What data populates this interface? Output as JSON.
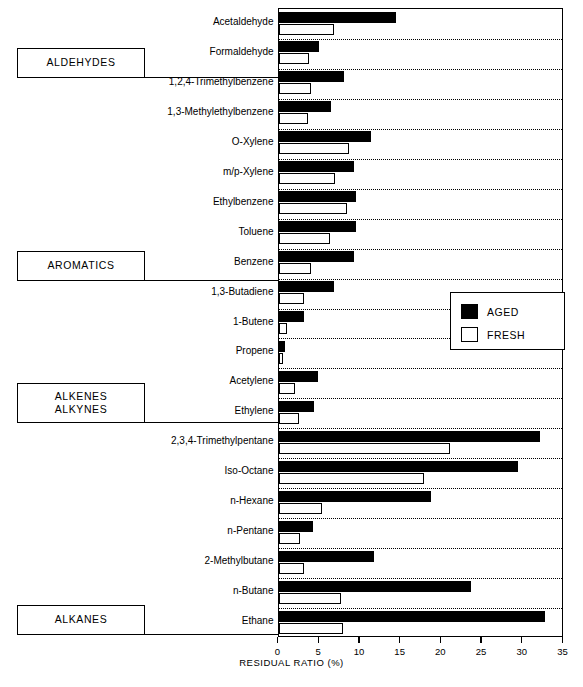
{
  "chart_data": {
    "type": "bar",
    "orientation": "horizontal",
    "title": "",
    "xlabel": "RESIDUAL RATIO (%)",
    "ylabel": "",
    "xlim": [
      0,
      35
    ],
    "xticks": [
      0,
      5,
      10,
      15,
      20,
      25,
      30,
      35
    ],
    "grid": false,
    "legend_position": "middle-right",
    "series": [
      {
        "name": "AGED",
        "color": "#000000",
        "values": [
          14.4,
          5.0,
          8.1,
          6.5,
          11.4,
          9.3,
          9.5,
          9.5,
          9.3,
          6.8,
          3.1,
          0.8,
          4.9,
          4.3,
          32.1,
          29.4,
          18.7,
          4.2,
          11.7,
          23.6,
          32.7
        ]
      },
      {
        "name": "FRESH",
        "color": "#ffffff",
        "values": [
          6.8,
          3.8,
          4.0,
          3.6,
          8.7,
          6.9,
          8.4,
          6.3,
          4.0,
          3.1,
          1.0,
          0.6,
          2.0,
          2.5,
          21.0,
          17.9,
          5.3,
          2.6,
          3.1,
          7.7,
          7.9
        ]
      }
    ],
    "categories": [
      "Acetaldehyde",
      "Formaldehyde",
      "1,2,4-Trimethylbenzene",
      "1,3-Methylethylbenzene",
      "O-Xylene",
      "m/p-Xylene",
      "Ethylbenzene",
      "Toluene",
      "Benzene",
      "1,3-Butadiene",
      "1-Butene",
      "Propene",
      "Acetylene",
      "Ethylene",
      "2,3,4-Trimethylpentane",
      "Iso-Octane",
      "n-Hexane",
      "n-Pentane",
      "2-Methylbutane",
      "n-Butane",
      "Ethane"
    ],
    "groups": [
      {
        "label": "ALDEHYDES",
        "start_index": 0,
        "end_index": 1
      },
      {
        "label": "AROMATICS",
        "start_index": 2,
        "end_index": 8
      },
      {
        "label": "ALKENES\nALKYNES",
        "start_index": 9,
        "end_index": 13
      },
      {
        "label": "ALKANES",
        "start_index": 14,
        "end_index": 20
      }
    ]
  },
  "legend": {
    "items": [
      {
        "label": "AGED",
        "style": "filled"
      },
      {
        "label": "FRESH",
        "style": "outline"
      }
    ]
  },
  "axis": {
    "title": "RESIDUAL RATIO (%)",
    "tick_labels": [
      "0",
      "5",
      "10",
      "15",
      "20",
      "25",
      "30",
      "35"
    ]
  },
  "group_labels": {
    "aldehydes": "ALDEHYDES",
    "aromatics": "AROMATICS",
    "alkenes_alkynes_line1": "ALKENES",
    "alkenes_alkynes_line2": "ALKYNES",
    "alkanes": "ALKANES"
  }
}
